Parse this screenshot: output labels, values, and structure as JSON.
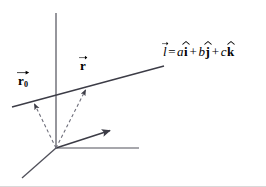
{
  "figure": {
    "background_color": "#ffffff",
    "stroke_color": "#3c3c46",
    "dashed_color": "#7a7a88",
    "text_color": "#000000"
  },
  "labels": {
    "r0": {
      "symbol": "r",
      "subscript": "0",
      "accent": "vector-arrow"
    },
    "r": {
      "symbol": "r",
      "subscript": "",
      "accent": "vector-arrow"
    }
  },
  "equation": {
    "lhs": "l",
    "equals": "=",
    "terms": [
      {
        "coefficient": "a",
        "unit": "i",
        "operator": ""
      },
      {
        "coefficient": "b",
        "unit": "j",
        "operator": "+"
      },
      {
        "coefficient": "c",
        "unit": "k",
        "operator": "+"
      }
    ],
    "plain_text": "l = a i + b j + c k"
  },
  "geometry": {
    "origin": {
      "x": 56,
      "y": 148
    },
    "axes": [
      {
        "name": "z-axis-vertical",
        "x1": 56,
        "y1": 13,
        "x2": 56,
        "y2": 148,
        "arrow": false
      },
      {
        "name": "x-axis-horizontal",
        "x1": 56,
        "y1": 148,
        "x2": 139,
        "y2": 148,
        "arrow": false
      },
      {
        "name": "y-axis-diagonal",
        "x1": 56,
        "y1": 148,
        "x2": 112,
        "y2": 130,
        "arrow": true
      },
      {
        "name": "axis-lower-left",
        "x1": 56,
        "y1": 148,
        "x2": 22,
        "y2": 178,
        "arrow": false
      }
    ],
    "line": {
      "name": "line-l",
      "x1": 12,
      "y1": 107,
      "x2": 164,
      "y2": 66
    },
    "vectors": [
      {
        "name": "vector-r0",
        "x1": 56,
        "y1": 148,
        "x2": 33,
        "y2": 101,
        "style": "dashed",
        "arrow": true
      },
      {
        "name": "vector-r",
        "x1": 56,
        "y1": 148,
        "x2": 87,
        "y2": 87,
        "style": "dashed",
        "arrow": true
      }
    ]
  }
}
